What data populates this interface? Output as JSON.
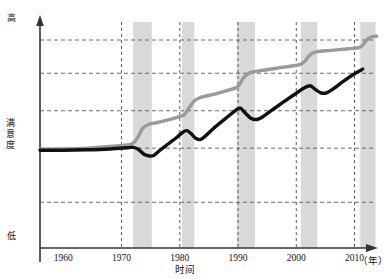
{
  "chart_data": {
    "type": "line",
    "title": "",
    "xlabel": "时间",
    "ylabel": "满意度",
    "x_unit": "（年）",
    "y_high_label": "高",
    "y_low_label": "低",
    "xlim": [
      1956,
      2013
    ],
    "ylim": [
      0,
      100
    ],
    "grid": true,
    "legend": "none",
    "xticks": [
      1960,
      1970,
      1980,
      1990,
      2000,
      2010
    ],
    "xtick_labels": [
      "1960",
      "1970",
      "1980",
      "1990",
      "2000",
      "2010"
    ],
    "vertical_gridlines": [
      1970,
      1980,
      1990,
      2000,
      2010
    ],
    "horizontal_gridlines": [
      22,
      48,
      66,
      84,
      100
    ],
    "shaded_bands": [
      {
        "start": 1972.0,
        "end": 1975.2
      },
      {
        "start": 1980.4,
        "end": 1982.5
      },
      {
        "start": 1989.8,
        "end": 1992.9
      },
      {
        "start": 2000.8,
        "end": 2003.6
      },
      {
        "start": 2011.0,
        "end": 2013.6
      }
    ],
    "band_color": "#d9d9d9",
    "series": [
      {
        "name": "上线",
        "color": "#9a9a9a",
        "width": 3.4,
        "points": [
          [
            1956,
            47.5
          ],
          [
            1960,
            47.6
          ],
          [
            1964,
            48.0
          ],
          [
            1968,
            48.8
          ],
          [
            1971,
            49.6
          ],
          [
            1972,
            50.4
          ],
          [
            1972.8,
            53.2
          ],
          [
            1973.6,
            57.4
          ],
          [
            1974.6,
            59.4
          ],
          [
            1976,
            60.2
          ],
          [
            1978,
            61.6
          ],
          [
            1980,
            63.2
          ],
          [
            1980.8,
            64.2
          ],
          [
            1981.6,
            67.4
          ],
          [
            1982.6,
            71.0
          ],
          [
            1983.6,
            72.4
          ],
          [
            1986,
            74.0
          ],
          [
            1988,
            75.6
          ],
          [
            1989.6,
            77.0
          ],
          [
            1990.2,
            78.4
          ],
          [
            1991.0,
            82.0
          ],
          [
            1992.0,
            84.2
          ],
          [
            1993.4,
            85.0
          ],
          [
            1996,
            86.2
          ],
          [
            1999,
            87.4
          ],
          [
            2000.6,
            88.2
          ],
          [
            2001.4,
            89.6
          ],
          [
            2002.4,
            93.0
          ],
          [
            2003.6,
            94.4
          ],
          [
            2006,
            95.0
          ],
          [
            2009,
            95.8
          ],
          [
            2010.8,
            96.4
          ],
          [
            2011.4,
            97.6
          ],
          [
            2012.2,
            100.4
          ],
          [
            2013.0,
            101.6
          ],
          [
            2013.8,
            101.8
          ]
        ]
      },
      {
        "name": "下线",
        "color": "#111111",
        "width": 3.4,
        "points": [
          [
            1956,
            47.0
          ],
          [
            1960,
            47.0
          ],
          [
            1964,
            47.2
          ],
          [
            1968,
            47.6
          ],
          [
            1971,
            48.2
          ],
          [
            1972,
            48.4
          ],
          [
            1972.8,
            47.6
          ],
          [
            1973.8,
            45.2
          ],
          [
            1974.8,
            44.2
          ],
          [
            1975.6,
            44.6
          ],
          [
            1976.6,
            47.0
          ],
          [
            1978,
            50.0
          ],
          [
            1979.4,
            53.0
          ],
          [
            1980.4,
            55.4
          ],
          [
            1981.2,
            56.4
          ],
          [
            1982.0,
            54.8
          ],
          [
            1982.8,
            52.6
          ],
          [
            1983.6,
            52.2
          ],
          [
            1984.6,
            54.4
          ],
          [
            1986,
            58.0
          ],
          [
            1988,
            62.6
          ],
          [
            1989.6,
            66.2
          ],
          [
            1990.4,
            67.2
          ],
          [
            1991.2,
            65.0
          ],
          [
            1992.2,
            62.4
          ],
          [
            1993.2,
            61.8
          ],
          [
            1994.4,
            63.4
          ],
          [
            1996,
            66.6
          ],
          [
            1998,
            70.6
          ],
          [
            2000,
            74.4
          ],
          [
            2001.4,
            77.0
          ],
          [
            2002.4,
            78.0
          ],
          [
            2003.2,
            76.4
          ],
          [
            2004.2,
            74.6
          ],
          [
            2005.2,
            74.6
          ],
          [
            2006.4,
            76.6
          ],
          [
            2008,
            80.0
          ],
          [
            2010,
            83.8
          ],
          [
            2011.4,
            86.0
          ]
        ]
      }
    ]
  },
  "axes": {
    "x_axis_name": "time-axis",
    "y_axis_name": "satisfaction-axis"
  }
}
